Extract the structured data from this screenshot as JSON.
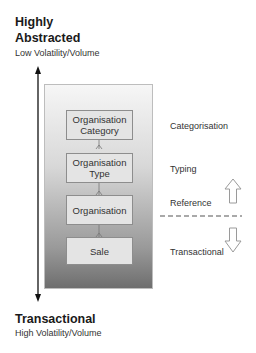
{
  "top": {
    "title_line1": "Highly",
    "title_line2": "Abstracted",
    "subtitle": "Low Volatility/Volume"
  },
  "bottom": {
    "title": "Transactional",
    "subtitle": "High Volatility/Volume"
  },
  "entities": [
    {
      "line1": "Organisation",
      "line2": "Category"
    },
    {
      "line1": "Organisation",
      "line2": "Type"
    },
    {
      "line1": "Organisation",
      "line2": ""
    },
    {
      "line1": "Sale",
      "line2": ""
    }
  ],
  "side_labels": {
    "categorisation": "Categorisation",
    "typing": "Typing",
    "reference": "Reference",
    "transactional": "Transactional"
  },
  "colors": {
    "axis": "#111111",
    "entity_fill": "#e4e4e4",
    "entity_border": "#8d8d8d",
    "dashed_line": "#555555",
    "hollow_arrow": "#9a9a9a"
  }
}
